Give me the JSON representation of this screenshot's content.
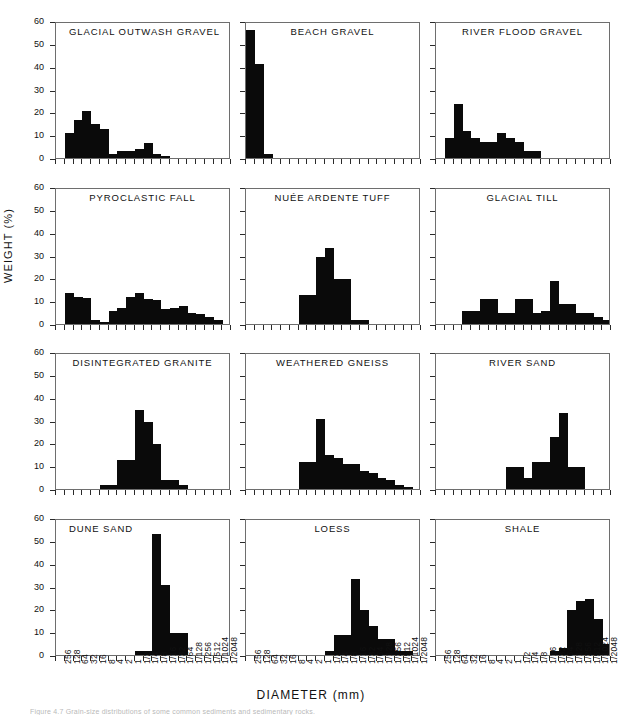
{
  "figure": {
    "xlabel": "DIAMETER (mm)",
    "ylabel": "WEIGHT (%)",
    "caption": "Figure 4.7   Grain-size distributions of some common sediments and sedimentary rocks."
  },
  "chart_data": {
    "type": "bar",
    "xlabel": "DIAMETER (mm)",
    "ylabel": "WEIGHT (%)",
    "ylim": [
      0,
      60
    ],
    "yticks": [
      0,
      10,
      20,
      30,
      40,
      50,
      60
    ],
    "grid": false,
    "legend": "none",
    "categories": [
      "256",
      "128",
      "64",
      "32",
      "16",
      "8",
      "4",
      "2",
      "1",
      "1/2",
      "1/4",
      "1/8",
      "1/16",
      "1/32",
      "1/64",
      "1/128",
      "1/256",
      "1/512",
      "1/1024",
      "1/2048"
    ],
    "panels": [
      {
        "name": "GLACIAL OUTWASH GRAVEL",
        "title_align": "left",
        "values": [
          0,
          11,
          17,
          21,
          15,
          13,
          2,
          3,
          3,
          4,
          6.5,
          2,
          1,
          0,
          0,
          0,
          0,
          0,
          0,
          0
        ]
      },
      {
        "name": "BEACH GRAVEL",
        "title_align": "center",
        "values": [
          57,
          42,
          2,
          0,
          0,
          0,
          0,
          0,
          0,
          0,
          0,
          0,
          0,
          0,
          0,
          0,
          0,
          0,
          0,
          0
        ]
      },
      {
        "name": "RIVER FLOOD GRAVEL",
        "title_align": "center",
        "values": [
          0,
          9,
          24,
          12,
          9,
          7,
          7,
          11,
          9,
          7,
          3,
          3,
          0,
          0,
          0,
          0,
          0,
          0,
          0,
          0
        ]
      },
      {
        "name": "PYROCLASTIC FALL",
        "title_align": "center",
        "values": [
          0,
          14,
          12,
          11.5,
          2,
          1,
          6,
          7,
          12,
          14,
          11,
          10.5,
          6.5,
          7,
          8,
          5,
          4.5,
          3,
          2,
          0
        ]
      },
      {
        "name": "NUÉE ARDENTE TUFF",
        "title_align": "center",
        "values": [
          0,
          0,
          0,
          0,
          0,
          0,
          13,
          13,
          30,
          34,
          20,
          20,
          2,
          2,
          0,
          0,
          0,
          0,
          0,
          0
        ]
      },
      {
        "name": "GLACIAL TILL",
        "title_align": "center",
        "values": [
          0,
          0,
          0,
          6,
          6,
          11,
          11,
          5,
          5,
          11,
          11,
          5,
          6,
          19,
          9,
          9,
          5,
          5,
          3,
          2
        ]
      },
      {
        "name": "DISINTEGRATED GRANITE",
        "title_align": "center",
        "values": [
          0,
          0,
          0,
          0,
          0,
          2,
          2,
          13,
          13,
          35,
          30,
          20,
          4,
          4,
          2,
          0,
          0,
          0,
          0,
          0
        ]
      },
      {
        "name": "WEATHERED GNEISS",
        "title_align": "center",
        "values": [
          0,
          0,
          0,
          0,
          0,
          0,
          12,
          12,
          31,
          15,
          14,
          11,
          11,
          8,
          7,
          5,
          4,
          2,
          1,
          0
        ]
      },
      {
        "name": "RIVER SAND",
        "title_align": "center",
        "values": [
          0,
          0,
          0,
          0,
          0,
          0,
          0,
          0,
          10,
          10,
          5,
          12,
          12,
          23,
          34,
          10,
          10,
          0,
          0,
          0
        ]
      },
      {
        "name": "DUNE SAND",
        "title_align": "left",
        "values": [
          0,
          0,
          0,
          0,
          0,
          0,
          0,
          0,
          0,
          2,
          2,
          54,
          31,
          10,
          10,
          0,
          0,
          0,
          0,
          0
        ]
      },
      {
        "name": "LOESS",
        "title_align": "center",
        "values": [
          0,
          0,
          0,
          0,
          0,
          0,
          0,
          0,
          0,
          2,
          9,
          9,
          34,
          20,
          13,
          7,
          7,
          2,
          2,
          0
        ]
      },
      {
        "name": "SHALE",
        "title_align": "center",
        "values": [
          0,
          0,
          0,
          0,
          0,
          0,
          0,
          0,
          0,
          0,
          0,
          0,
          0,
          2,
          3,
          20,
          24,
          25,
          16,
          5
        ]
      }
    ]
  }
}
